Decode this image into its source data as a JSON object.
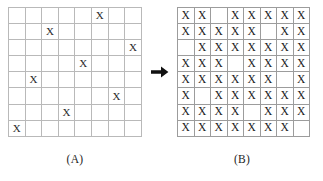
{
  "figure": {
    "arrow_icon": "arrow-right-icon",
    "mark_glyph": "X"
  },
  "panel_a": {
    "caption": "(A)",
    "rows": 8,
    "cols": 8,
    "grid": [
      [
        "",
        "",
        "",
        "",
        "",
        "X",
        "",
        ""
      ],
      [
        "",
        "",
        "X",
        "",
        "",
        "",
        "",
        ""
      ],
      [
        "",
        "",
        "",
        "",
        "",
        "",
        "",
        "X"
      ],
      [
        "",
        "",
        "",
        "",
        "X",
        "",
        "",
        ""
      ],
      [
        "",
        "X",
        "",
        "",
        "",
        "",
        "",
        ""
      ],
      [
        "",
        "",
        "",
        "",
        "",
        "",
        "X",
        ""
      ],
      [
        "",
        "",
        "",
        "X",
        "",
        "",
        "",
        ""
      ],
      [
        "X",
        "",
        "",
        "",
        "",
        "",
        "",
        ""
      ]
    ]
  },
  "panel_b": {
    "caption": "(B)",
    "rows": 8,
    "cols": 8,
    "grid": [
      [
        "X",
        "X",
        "",
        "X",
        "X",
        "X",
        "X",
        "X"
      ],
      [
        "X",
        "X",
        "X",
        "X",
        "X",
        "",
        "X",
        "X"
      ],
      [
        "",
        "X",
        "X",
        "X",
        "X",
        "X",
        "X",
        "X"
      ],
      [
        "X",
        "X",
        "X",
        "",
        "X",
        "X",
        "X",
        "X"
      ],
      [
        "X",
        "X",
        "X",
        "X",
        "X",
        "X",
        "",
        "X"
      ],
      [
        "X",
        "",
        "X",
        "X",
        "X",
        "X",
        "X",
        "X"
      ],
      [
        "X",
        "X",
        "X",
        "X",
        "",
        "X",
        "X",
        "X"
      ],
      [
        "X",
        "X",
        "X",
        "X",
        "X",
        "X",
        "X",
        ""
      ]
    ]
  }
}
